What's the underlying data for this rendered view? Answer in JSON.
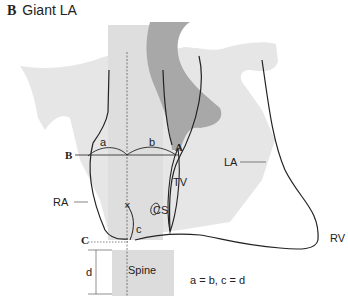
{
  "figure": {
    "panel_letter": "B",
    "title": "Giant LA"
  },
  "labels": {
    "a": "a",
    "b": "b",
    "c": "c",
    "d": "d",
    "point_A": "A",
    "point_B": "B",
    "point_C": "C",
    "TV": "TV",
    "CS": "CS",
    "RA": "RA",
    "LA": "LA",
    "RV": "RV",
    "spine": "Spine",
    "equation": "a = b,  c = d"
  },
  "colors": {
    "light_shadow": "#e6e6e6",
    "mid_shadow": "#d6d6d6",
    "dark_shadow": "#a8a8a8",
    "line": "#222222"
  }
}
